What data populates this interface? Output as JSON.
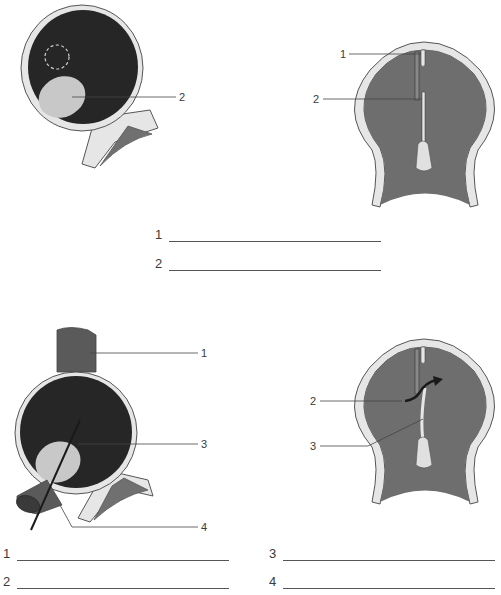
{
  "figures": {
    "top_left": {
      "labels": [
        {
          "id": "2",
          "text": "2"
        }
      ]
    },
    "top_right": {
      "labels": [
        {
          "id": "1",
          "text": "1"
        },
        {
          "id": "2",
          "text": "2"
        }
      ]
    },
    "bottom_left": {
      "labels": [
        {
          "id": "1",
          "text": "1"
        },
        {
          "id": "3",
          "text": "3"
        },
        {
          "id": "4",
          "text": "4"
        }
      ]
    },
    "bottom_right": {
      "labels": [
        {
          "id": "2",
          "text": "2"
        },
        {
          "id": "3",
          "text": "3"
        }
      ]
    }
  },
  "answer_blanks": {
    "top": [
      {
        "number": "1",
        "value": ""
      },
      {
        "number": "2",
        "value": ""
      }
    ],
    "bottom": [
      {
        "number": "1",
        "value": ""
      },
      {
        "number": "2",
        "value": ""
      },
      {
        "number": "3",
        "value": ""
      },
      {
        "number": "4",
        "value": ""
      }
    ]
  },
  "colors": {
    "dark_chamber": "#262626",
    "septum_gray": "#6e6e6e",
    "wall_light": "#e6e6e6",
    "valve_light": "#c8c8c8",
    "outline": "#555555",
    "leader_line": "#444444"
  }
}
